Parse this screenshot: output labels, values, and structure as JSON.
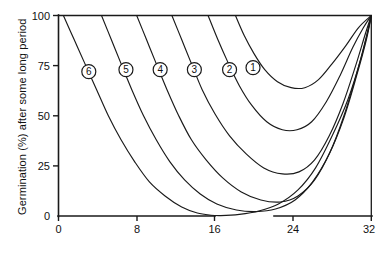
{
  "chart_data": {
    "type": "line",
    "title": "",
    "xlabel": "",
    "ylabel": "Germination (%) after some long period",
    "xlim": [
      0,
      32
    ],
    "ylim": [
      0,
      100
    ],
    "grid": false,
    "legend_position": "inline-curve-labels",
    "axis_break": {
      "present": true,
      "from": 16,
      "to": 24
    },
    "xticks": [
      {
        "value": 0,
        "label": "0"
      },
      {
        "value": 8,
        "label": "8"
      },
      {
        "value": 16,
        "label": "16"
      },
      {
        "value": 24,
        "label": "24"
      },
      {
        "value": 32,
        "label": "32"
      }
    ],
    "yticks": [
      {
        "value": 0,
        "label": "0"
      },
      {
        "value": 25,
        "label": "25"
      },
      {
        "value": 50,
        "label": "50"
      },
      {
        "value": 75,
        "label": "75"
      },
      {
        "value": 100,
        "label": "100"
      }
    ],
    "series": [
      {
        "name": "6",
        "label": "6",
        "label_point": {
          "x": 3.1,
          "y": 72
        },
        "points": [
          {
            "x": 0.5,
            "y": 100
          },
          {
            "x": 1.6,
            "y": 88
          },
          {
            "x": 2.7,
            "y": 76
          },
          {
            "x": 3.9,
            "y": 63
          },
          {
            "x": 5.1,
            "y": 50
          },
          {
            "x": 6.4,
            "y": 38
          },
          {
            "x": 7.8,
            "y": 27
          },
          {
            "x": 9.3,
            "y": 17
          },
          {
            "x": 10.9,
            "y": 10
          },
          {
            "x": 12.6,
            "y": 4.5
          },
          {
            "x": 14.2,
            "y": 1.5
          },
          {
            "x": 15.6,
            "y": 0.4
          },
          {
            "x": 16.6,
            "y": 0.2
          },
          {
            "x": 18.5,
            "y": 0.8
          },
          {
            "x": 20.5,
            "y": 2.5
          },
          {
            "x": 22.5,
            "y": 6
          },
          {
            "x": 24.5,
            "y": 13
          },
          {
            "x": 26.3,
            "y": 24
          },
          {
            "x": 28.0,
            "y": 40
          },
          {
            "x": 29.6,
            "y": 58
          },
          {
            "x": 30.9,
            "y": 78
          },
          {
            "x": 32.0,
            "y": 100
          }
        ]
      },
      {
        "name": "5",
        "label": "5",
        "label_point": {
          "x": 6.9,
          "y": 73
        },
        "points": [
          {
            "x": 4.4,
            "y": 100
          },
          {
            "x": 5.4,
            "y": 88
          },
          {
            "x": 6.4,
            "y": 76
          },
          {
            "x": 7.5,
            "y": 63
          },
          {
            "x": 8.7,
            "y": 50
          },
          {
            "x": 10.0,
            "y": 38
          },
          {
            "x": 11.4,
            "y": 27
          },
          {
            "x": 12.9,
            "y": 18
          },
          {
            "x": 14.5,
            "y": 11
          },
          {
            "x": 16.2,
            "y": 6
          },
          {
            "x": 18.2,
            "y": 3
          },
          {
            "x": 20.2,
            "y": 2.2
          },
          {
            "x": 22.2,
            "y": 3.5
          },
          {
            "x": 24.2,
            "y": 8
          },
          {
            "x": 26.0,
            "y": 17
          },
          {
            "x": 27.7,
            "y": 31
          },
          {
            "x": 29.2,
            "y": 49
          },
          {
            "x": 30.5,
            "y": 70
          },
          {
            "x": 31.5,
            "y": 88
          },
          {
            "x": 32.0,
            "y": 100
          }
        ]
      },
      {
        "name": "4",
        "label": "4",
        "label_point": {
          "x": 10.4,
          "y": 73
        },
        "points": [
          {
            "x": 8.0,
            "y": 100
          },
          {
            "x": 9.0,
            "y": 88
          },
          {
            "x": 10.0,
            "y": 76
          },
          {
            "x": 11.1,
            "y": 63
          },
          {
            "x": 12.3,
            "y": 50
          },
          {
            "x": 13.6,
            "y": 38
          },
          {
            "x": 15.1,
            "y": 28
          },
          {
            "x": 16.8,
            "y": 19
          },
          {
            "x": 18.7,
            "y": 12
          },
          {
            "x": 20.7,
            "y": 8
          },
          {
            "x": 22.7,
            "y": 7
          },
          {
            "x": 24.5,
            "y": 10
          },
          {
            "x": 26.2,
            "y": 18
          },
          {
            "x": 27.8,
            "y": 32
          },
          {
            "x": 29.2,
            "y": 50
          },
          {
            "x": 30.5,
            "y": 71
          },
          {
            "x": 31.5,
            "y": 89
          },
          {
            "x": 32.0,
            "y": 100
          }
        ]
      },
      {
        "name": "3",
        "label": "3",
        "label_point": {
          "x": 13.9,
          "y": 73
        },
        "points": [
          {
            "x": 11.6,
            "y": 100
          },
          {
            "x": 12.6,
            "y": 88
          },
          {
            "x": 13.6,
            "y": 76
          },
          {
            "x": 14.7,
            "y": 63
          },
          {
            "x": 16.0,
            "y": 51
          },
          {
            "x": 17.5,
            "y": 40
          },
          {
            "x": 19.2,
            "y": 31
          },
          {
            "x": 21.0,
            "y": 24
          },
          {
            "x": 22.9,
            "y": 21
          },
          {
            "x": 24.6,
            "y": 22
          },
          {
            "x": 26.2,
            "y": 28
          },
          {
            "x": 27.7,
            "y": 40
          },
          {
            "x": 29.1,
            "y": 56
          },
          {
            "x": 30.4,
            "y": 75
          },
          {
            "x": 31.4,
            "y": 91
          },
          {
            "x": 32.0,
            "y": 100
          }
        ]
      },
      {
        "name": "2",
        "label": "2",
        "label_point": {
          "x": 17.5,
          "y": 73
        },
        "points": [
          {
            "x": 15.3,
            "y": 100
          },
          {
            "x": 16.3,
            "y": 88
          },
          {
            "x": 17.3,
            "y": 77
          },
          {
            "x": 18.5,
            "y": 65
          },
          {
            "x": 19.8,
            "y": 55
          },
          {
            "x": 21.3,
            "y": 47
          },
          {
            "x": 22.9,
            "y": 43
          },
          {
            "x": 24.4,
            "y": 43
          },
          {
            "x": 25.9,
            "y": 47
          },
          {
            "x": 27.4,
            "y": 57
          },
          {
            "x": 28.8,
            "y": 70
          },
          {
            "x": 30.1,
            "y": 84
          },
          {
            "x": 31.2,
            "y": 94
          },
          {
            "x": 32.0,
            "y": 100
          }
        ]
      },
      {
        "name": "1",
        "label": "1",
        "label_point": {
          "x": 19.9,
          "y": 74
        },
        "points": [
          {
            "x": 18.1,
            "y": 100
          },
          {
            "x": 19.0,
            "y": 90
          },
          {
            "x": 20.0,
            "y": 81
          },
          {
            "x": 21.1,
            "y": 73
          },
          {
            "x": 22.4,
            "y": 67
          },
          {
            "x": 23.8,
            "y": 64
          },
          {
            "x": 25.2,
            "y": 64
          },
          {
            "x": 26.6,
            "y": 68
          },
          {
            "x": 28.0,
            "y": 76
          },
          {
            "x": 29.4,
            "y": 85
          },
          {
            "x": 30.7,
            "y": 94
          },
          {
            "x": 32.0,
            "y": 100
          }
        ]
      }
    ]
  }
}
